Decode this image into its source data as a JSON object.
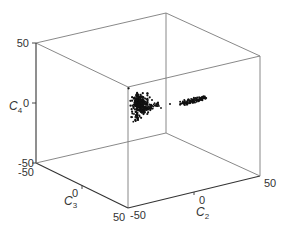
{
  "chart_data": {
    "type": "scatter",
    "dimensions": 3,
    "title": "",
    "axes": {
      "x": {
        "label": "C2",
        "label_main": "C",
        "label_sub": "2",
        "range": [
          -50,
          50
        ],
        "ticks": [
          -50,
          0,
          50
        ],
        "tick_labels": [
          "-50",
          "0",
          "50"
        ]
      },
      "y": {
        "label": "C3",
        "label_main": "C",
        "label_sub": "3",
        "range": [
          -50,
          50
        ],
        "ticks": [
          -50,
          0,
          50
        ],
        "tick_labels": [
          "-50",
          "0",
          "50"
        ]
      },
      "z": {
        "label": "C4",
        "label_main": "C",
        "label_sub": "4",
        "range": [
          -50,
          50
        ],
        "ticks": [
          -50,
          0,
          50
        ],
        "tick_labels": [
          "-50",
          "0",
          "50"
        ]
      }
    },
    "grid": false,
    "box": true,
    "legend": null,
    "series": [
      {
        "name": "cluster-1",
        "description": "dense blob of points near the front-left region of the cube center",
        "color": "#111111",
        "approx_center": {
          "C2": -15,
          "C3": 15,
          "C4": -2
        },
        "approx_spread": 10
      },
      {
        "name": "cluster-2",
        "description": "elongated streak of points to the right of cluster-1",
        "color": "#111111",
        "approx_center": {
          "C2": 20,
          "C3": 5,
          "C4": 5
        },
        "approx_spread": 8
      }
    ]
  },
  "labels": {
    "z_top": "50",
    "z_mid": "0",
    "z_bottom": "-50",
    "y_start": "-50",
    "y_mid": "0",
    "y_end": "50",
    "x_start": "-50",
    "x_mid": "0",
    "x_end": "50",
    "z_axis_main": "C",
    "z_axis_sub": "4",
    "y_axis_main": "C",
    "y_axis_sub": "3",
    "x_axis_main": "C",
    "x_axis_sub": "2"
  }
}
